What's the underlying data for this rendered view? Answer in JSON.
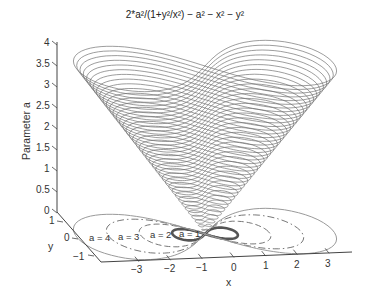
{
  "chart_data": {
    "type": "surface3d",
    "title": "2*a²/(1+y²/x²) − a² − x² − y²",
    "xlabel": "x",
    "ylabel": "y",
    "zlabel": "Parameter a",
    "x_ticks": [
      "−3",
      "−2",
      "−1",
      "0",
      "1",
      "2",
      "3"
    ],
    "y_ticks": [
      "1",
      "0",
      "−1"
    ],
    "z_ticks": [
      "4",
      "3.5",
      "3",
      "2.5",
      "2",
      "1.5",
      "1",
      "0.5",
      "0"
    ],
    "xlim": [
      -3.5,
      3.5
    ],
    "ylim": [
      -1.5,
      1.5
    ],
    "zlim": [
      0,
      4
    ],
    "surface": {
      "description": "Stack of Bernoulli lemniscates r² = a² cos 2θ drawn at height z = a",
      "a_min": 0.1,
      "a_max": 4.0,
      "a_step": 0.1,
      "line_color": "#6e6e6e"
    },
    "floor_contours": [
      {
        "a": 1,
        "label": "a = 1",
        "style": "solid-thick",
        "color": "#555555"
      },
      {
        "a": 2,
        "label": "a = 2",
        "style": "dashed",
        "color": "#777777"
      },
      {
        "a": 3,
        "label": "a = 3",
        "style": "dash-dot",
        "color": "#777777"
      },
      {
        "a": 4,
        "label": "a = 4",
        "style": "solid",
        "color": "#9a9a9a"
      }
    ],
    "grid": false,
    "legend": "none"
  }
}
